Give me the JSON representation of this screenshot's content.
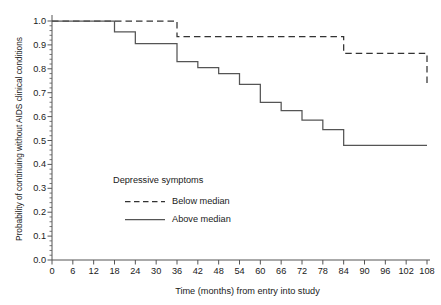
{
  "chart_data": {
    "type": "line",
    "title": "",
    "xlabel": "Time (months) from entry into study",
    "ylabel": "Probability of continuing without AIDS clinical conditions",
    "xlim": [
      0,
      108
    ],
    "ylim": [
      0.0,
      1.0
    ],
    "xticks": [
      0,
      6,
      12,
      18,
      24,
      30,
      36,
      42,
      48,
      54,
      60,
      66,
      72,
      78,
      84,
      90,
      96,
      102,
      108
    ],
    "yticks": [
      "0.0",
      "0.1",
      "0.2",
      "0.3",
      "0.4",
      "0.5",
      "0.6",
      "0.7",
      "0.8",
      "0.9",
      "1.0"
    ],
    "grid": false,
    "legend_position": "center-left-inside",
    "legend_title": "Depressive symptoms",
    "step_style": "post",
    "series": [
      {
        "name": "Below median",
        "style": "dashed",
        "color": "#333333",
        "x": [
          0,
          30,
          36,
          78,
          84,
          102,
          108
        ],
        "y": [
          1.0,
          1.0,
          0.935,
          0.935,
          0.865,
          0.865,
          0.74
        ]
      },
      {
        "name": "Above median",
        "style": "solid",
        "color": "#555555",
        "x": [
          0,
          12,
          18,
          24,
          30,
          36,
          42,
          48,
          54,
          60,
          66,
          72,
          78,
          84,
          108
        ],
        "y": [
          1.0,
          1.0,
          0.955,
          0.905,
          0.905,
          0.83,
          0.805,
          0.78,
          0.735,
          0.66,
          0.625,
          0.585,
          0.545,
          0.48,
          0.48
        ]
      }
    ]
  },
  "axes": {
    "x_tick_labels": [
      "0",
      "6",
      "12",
      "18",
      "24",
      "30",
      "36",
      "42",
      "48",
      "54",
      "60",
      "66",
      "72",
      "78",
      "84",
      "90",
      "96",
      "102",
      "108"
    ],
    "y_tick_labels": [
      "1.0",
      "0.9",
      "0.8",
      "0.7",
      "0.6",
      "0.5",
      "0.4",
      "0.3",
      "0.2",
      "0.1",
      "0.0"
    ]
  },
  "legend": {
    "title": "Depressive symptoms",
    "entries": [
      {
        "label": "Below median",
        "style": "dashed"
      },
      {
        "label": "Above median",
        "style": "solid"
      }
    ]
  }
}
